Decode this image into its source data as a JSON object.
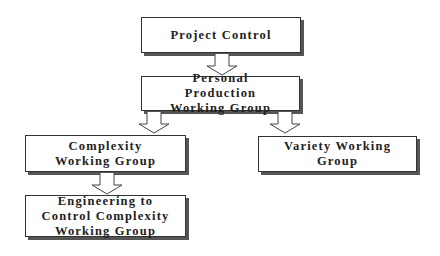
{
  "diagram": {
    "type": "org-chart",
    "nodes": [
      {
        "id": "project-control",
        "label": "Project Control"
      },
      {
        "id": "personal-production",
        "label": "Personal Production Working Group"
      },
      {
        "id": "complexity",
        "label": "Complexity Working Group"
      },
      {
        "id": "variety",
        "label": "Variety Working Group"
      },
      {
        "id": "engineering-control",
        "label": "Engineering to Control Complexity Working Group"
      }
    ],
    "edges": [
      {
        "from": "project-control",
        "to": "personal-production"
      },
      {
        "from": "personal-production",
        "to": "complexity"
      },
      {
        "from": "personal-production",
        "to": "variety"
      },
      {
        "from": "complexity",
        "to": "engineering-control"
      }
    ]
  }
}
